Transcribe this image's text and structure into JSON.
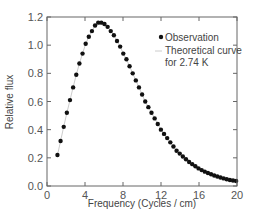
{
  "chart_data": {
    "type": "scatter",
    "title": "",
    "xlabel": "Frequency (Cycles / cm)",
    "ylabel": "Relative flux",
    "xlim": [
      0,
      20
    ],
    "ylim": [
      0,
      1.2
    ],
    "xticks": [
      0,
      4,
      8,
      12,
      16,
      20
    ],
    "yticks": [
      0.0,
      0.2,
      0.4,
      0.6,
      0.8,
      1.0,
      1.2
    ],
    "xtick_labels": [
      "0",
      "4",
      "8",
      "12",
      "16",
      "20"
    ],
    "ytick_labels": [
      "0.0",
      "0.2",
      "0.4",
      "0.6",
      "0.8",
      "1.0",
      "1.2"
    ],
    "grid": false,
    "legend_position": "upper right",
    "series": [
      {
        "name": "Observation",
        "marker": "filled-circle",
        "color": "#111111",
        "x": [
          1.1,
          1.43,
          1.76,
          2.09,
          2.42,
          2.75,
          3.08,
          3.41,
          3.74,
          4.07,
          4.4,
          4.73,
          5.06,
          5.39,
          5.72,
          6.05,
          6.38,
          6.71,
          7.04,
          7.37,
          7.7,
          8.03,
          8.36,
          8.69,
          9.02,
          9.35,
          9.68,
          10.01,
          10.34,
          10.67,
          11.0,
          11.33,
          11.66,
          11.99,
          12.32,
          12.65,
          12.98,
          13.31,
          13.64,
          13.97,
          14.3,
          14.63,
          14.96,
          15.29,
          15.62,
          15.95,
          16.28,
          16.61,
          16.94,
          17.27,
          17.6,
          17.93,
          18.26,
          18.59,
          18.92,
          19.25,
          19.58,
          19.91
        ],
        "y": [
          0.22,
          0.32,
          0.42,
          0.52,
          0.61,
          0.7,
          0.79,
          0.87,
          0.94,
          1.01,
          1.06,
          1.1,
          1.14,
          1.16,
          1.16,
          1.15,
          1.13,
          1.1,
          1.07,
          1.03,
          0.99,
          0.94,
          0.9,
          0.85,
          0.8,
          0.75,
          0.7,
          0.65,
          0.6,
          0.56,
          0.52,
          0.48,
          0.44,
          0.4,
          0.37,
          0.34,
          0.31,
          0.28,
          0.25,
          0.23,
          0.21,
          0.19,
          0.17,
          0.155,
          0.14,
          0.125,
          0.113,
          0.102,
          0.092,
          0.083,
          0.075,
          0.067,
          0.06,
          0.054,
          0.048,
          0.043,
          0.039,
          0.035
        ]
      },
      {
        "name": "Theoretical curve for 2.74 K",
        "marker": "line",
        "color": "#cccccc"
      }
    ]
  },
  "legend": {
    "observation_label": "Observation",
    "theory_label_line1": "Theoretical curve",
    "theory_label_line2": "for 2.74 K"
  }
}
